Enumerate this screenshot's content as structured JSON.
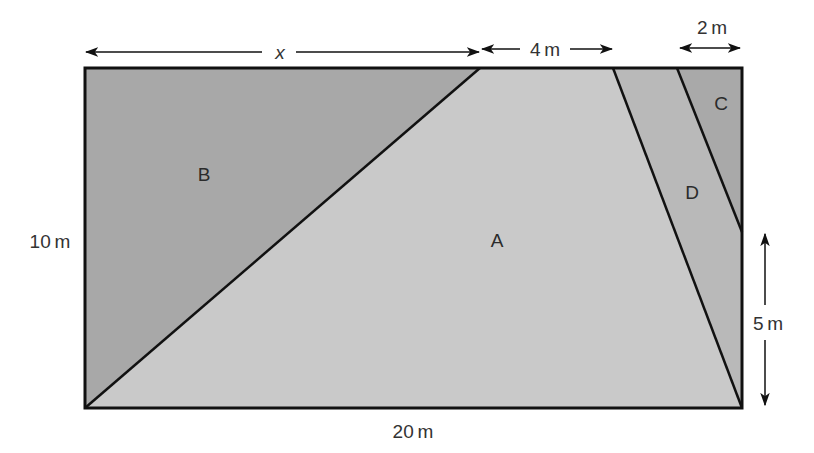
{
  "diagram": {
    "title": "",
    "regions": [
      {
        "id": "A",
        "label": "A",
        "fill": "#c9c9c9"
      },
      {
        "id": "B",
        "label": "B",
        "fill": "#a8a8a8"
      },
      {
        "id": "C",
        "label": "C",
        "fill": "#a9a9a9"
      },
      {
        "id": "D",
        "label": "D",
        "fill": "#b9b9b9"
      }
    ],
    "dimensions": {
      "top_x": "x",
      "top_4m": "4 m",
      "top_2m": "2 m",
      "left_height": "10 m",
      "bottom_width": "20 m",
      "right_5m": "5 m"
    },
    "colors": {
      "stroke": "#111111",
      "arrow": "#111111",
      "text": "#333333"
    }
  }
}
